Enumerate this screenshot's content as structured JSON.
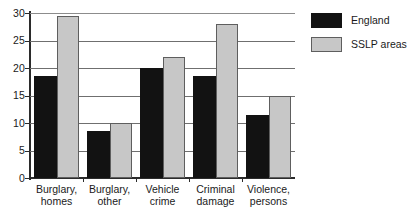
{
  "chart_data": {
    "type": "bar",
    "title": "",
    "subtitle": "",
    "xlabel": "",
    "ylabel": "",
    "ylim": [
      0,
      30
    ],
    "yticks": [
      0,
      5,
      10,
      15,
      20,
      25,
      30
    ],
    "ytick_labels": [
      "0",
      "5",
      "10",
      "15",
      "20",
      "25",
      "30"
    ],
    "grid": true,
    "grid_axis": "y",
    "legend_position": "right",
    "categories": [
      "Burglary, homes",
      "Burglary, other",
      "Vehicle crime",
      "Criminal damage",
      "Violence, persons"
    ],
    "category_lines": [
      [
        "Burglary,",
        "homes"
      ],
      [
        "Burglary,",
        "other"
      ],
      [
        "Vehicle",
        "crime"
      ],
      [
        "Criminal",
        "damage"
      ],
      [
        "Violence,",
        "persons"
      ]
    ],
    "series": [
      {
        "name": "England",
        "color": "#121212",
        "values": [
          18.5,
          8.5,
          20.0,
          18.5,
          11.5
        ]
      },
      {
        "name": "SSLP areas",
        "color": "#c7c7c7",
        "values": [
          29.5,
          10.0,
          22.0,
          28.0,
          15.0
        ]
      }
    ]
  },
  "legend": {
    "items": [
      {
        "label": "England",
        "swatch": "england"
      },
      {
        "label": "SSLP areas",
        "swatch": "sslp"
      }
    ]
  },
  "colors": {
    "england_fill": "#121212",
    "sslp_fill": "#c7c7c7",
    "sslp_border": "#5e5e5e",
    "axis": "#2b2b2b",
    "gridline": "#6f6f6f",
    "text": "#1a1a1a",
    "background": "#ffffff"
  }
}
